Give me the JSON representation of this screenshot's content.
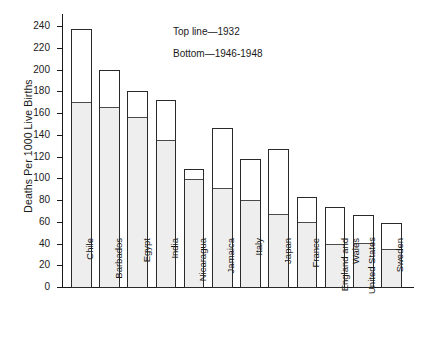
{
  "chart_data": {
    "type": "bar",
    "title": "",
    "xlabel": "",
    "ylabel": "Deaths Per 1000 Live Births",
    "ylim": [
      0,
      240
    ],
    "ytick_step": 20,
    "yticks": [
      0,
      20,
      40,
      60,
      80,
      100,
      120,
      140,
      160,
      180,
      200,
      220,
      240
    ],
    "grid": false,
    "legend_position": "inside-top-right",
    "stacked_style": "overlaid-range",
    "categories": [
      "Chile",
      "Barbados",
      "Egypt",
      "India",
      "Nicaragua",
      "Jamaica",
      "Italy",
      "Japan",
      "France",
      "England and\nWales",
      "United States",
      "Sweden"
    ],
    "series": [
      {
        "name": "Top line—1932",
        "values": [
          237,
          200,
          180,
          172,
          109,
          146,
          118,
          127,
          83,
          74,
          66,
          59
        ]
      },
      {
        "name": "Bottom—1946-1948",
        "values": [
          170,
          166,
          156,
          135,
          99,
          91,
          80,
          67,
          60,
          40,
          40,
          35
        ]
      }
    ],
    "annotations": [
      "Top line—1932",
      "Bottom—1946-1948"
    ]
  },
  "colors": {
    "axis": "#1a1a1a",
    "bar_outline": "#2a2a2a",
    "bar_lower_fill": "#eeeeee",
    "bar_upper_fill": "#ffffff",
    "background": "#ffffff"
  }
}
